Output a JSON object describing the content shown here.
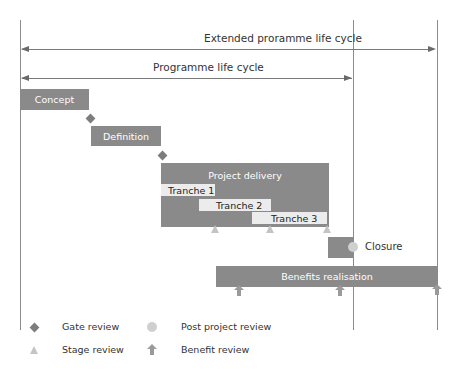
{
  "diagram": {
    "spans": {
      "extended": "Extended proramme life cycle",
      "programme": "Programme life cycle"
    },
    "phases": {
      "concept": "Concept",
      "definition": "Definition",
      "project_delivery": "Project delivery",
      "tranche1": "Tranche 1",
      "tranche2": "Tranche 2",
      "tranche3": "Tranche 3",
      "closure": "Closure",
      "benefits": "Benefits realisation"
    },
    "legend": {
      "gate": "Gate review",
      "stage": "Stage review",
      "post_project": "Post project review",
      "benefit": "Benefit review"
    },
    "colors": {
      "phase_box": "#8a8a8a",
      "tranche_box": "#ececec",
      "gate_marker": "#7d7d7d",
      "stage_marker": "#c4c4c4",
      "post_project_marker": "#cfcfcf",
      "benefit_marker": "#9a9a9a",
      "lines": "#8c8c8c"
    }
  }
}
